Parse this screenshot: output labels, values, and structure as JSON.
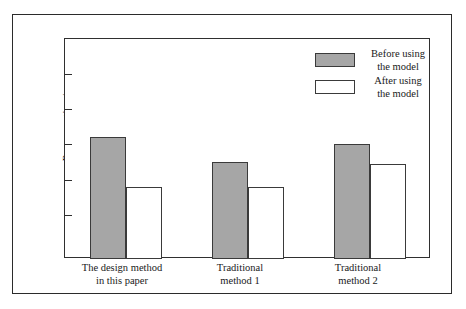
{
  "chart_data": {
    "type": "bar",
    "title": "",
    "xlabel": "",
    "ylabel": "Response time/s",
    "ylim": [
      8.7,
      40.0
    ],
    "yticks": [
      15,
      20,
      25,
      30,
      35
    ],
    "ytick_labels": [
      "15",
      "20",
      "25",
      "30",
      "35"
    ],
    "grid": false,
    "legend_position": "top-right",
    "categories": [
      "The design method\nin this paper",
      "Traditional\nmethod 1",
      "Traditional\nmethod 2"
    ],
    "category_lines": [
      [
        "The design method",
        "in this paper"
      ],
      [
        "Traditional",
        "method 1"
      ],
      [
        "Traditional",
        "method 2"
      ]
    ],
    "series": [
      {
        "name": "Before using the model",
        "color": "#a6a6a6",
        "values": [
          26.0,
          22.5,
          25.1
        ]
      },
      {
        "name": "After using the model",
        "color": "#ffffff",
        "values": [
          19.0,
          19.0,
          22.2
        ]
      }
    ]
  },
  "axis": {
    "y_label": "Response time/s",
    "tick_15": "15",
    "tick_20": "20",
    "tick_25": "25",
    "tick_30": "30",
    "tick_35": "35"
  },
  "legend": {
    "before_line1": "Before using",
    "before_line2": "the model",
    "after_line1": "After using",
    "after_line2": "the model"
  },
  "categories": {
    "c0_line1": "The design method",
    "c0_line2": "in this paper",
    "c1_line1": "Traditional",
    "c1_line2": "method 1",
    "c2_line1": "Traditional",
    "c2_line2": "method 2"
  }
}
